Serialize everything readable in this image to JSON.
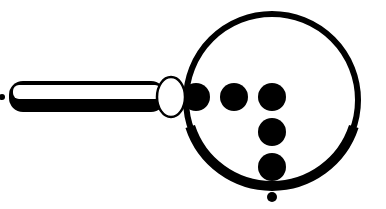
{
  "figure": {
    "colors": {
      "ink": "#000000",
      "paper": "#ffffff"
    },
    "ring": {
      "cx": 272,
      "cy": 100,
      "r": 86,
      "stroke_width": 6
    },
    "handle": {
      "x": 9,
      "y": 81,
      "width": 156,
      "height": 31,
      "rx": 14
    },
    "collar": {
      "cx": 171,
      "cy": 97,
      "rx": 14,
      "ry": 20
    },
    "left_tip_dot": {
      "cx": 2,
      "cy": 97,
      "r": 3
    },
    "dots": [
      {
        "cx": 196,
        "cy": 97,
        "r": 14
      },
      {
        "cx": 234,
        "cy": 97,
        "r": 14
      },
      {
        "cx": 272,
        "cy": 97,
        "r": 14
      },
      {
        "cx": 272,
        "cy": 132,
        "r": 14
      },
      {
        "cx": 272,
        "cy": 167,
        "r": 14
      }
    ],
    "small_dot": {
      "cx": 272,
      "cy": 197,
      "r": 5
    }
  }
}
